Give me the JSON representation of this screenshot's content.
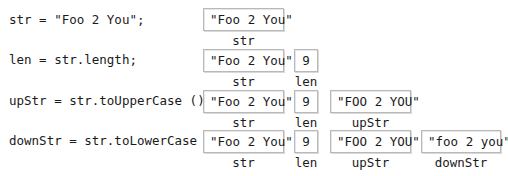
{
  "rows": [
    {
      "code": "str = \"Foo 2 You\";",
      "vars": [
        {
          "value": "\"Foo 2 You\"",
          "name": "str"
        }
      ]
    },
    {
      "code": "len = str.length;",
      "vars": [
        {
          "value": "\"Foo 2 You\"",
          "name": "str"
        },
        {
          "value": "9",
          "name": "len"
        }
      ]
    },
    {
      "code": "upStr = str.toUpperCase ();",
      "vars": [
        {
          "value": "\"Foo 2 You\"",
          "name": "str"
        },
        {
          "value": "9",
          "name": "len"
        },
        {
          "value": "\"FOO 2 YOU\"",
          "name": "upStr"
        }
      ]
    },
    {
      "code": "downStr = str.toLowerCase ();",
      "vars": [
        {
          "value": "\"Foo 2 You\"",
          "name": "str"
        },
        {
          "value": "9",
          "name": "len"
        },
        {
          "value": "\"FOO 2 YOU\"",
          "name": "upStr"
        },
        {
          "value": "\"foo 2 you\"",
          "name": "downStr"
        }
      ]
    }
  ]
}
